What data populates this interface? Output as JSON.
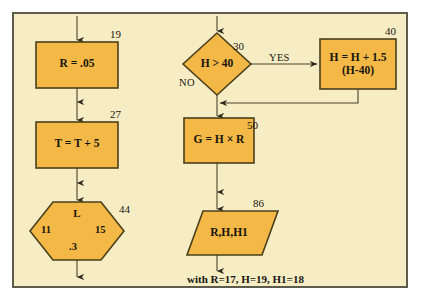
{
  "figure": {
    "type": "flowchart",
    "panel_background": "#f6edc4",
    "node_fill": "#f3b845",
    "node_stroke": "#4a3f1c",
    "line_color": "#4a4330",
    "text_color": "#171510"
  },
  "nodes": [
    {
      "id": "r-assign",
      "shape": "process",
      "text": "R = .05",
      "step": "19",
      "x": 36,
      "y": 42,
      "w": 82,
      "h": 46
    },
    {
      "id": "t-assign",
      "shape": "process",
      "text": "T = T + 5",
      "step": "27",
      "x": 36,
      "y": 122,
      "w": 82,
      "h": 46
    },
    {
      "id": "l-loop",
      "shape": "hexagon",
      "text": "L",
      "step": "44",
      "left_value": "11",
      "right_value": "15",
      "bottom_value": ".3",
      "x": 30,
      "y": 202,
      "w": 94,
      "h": 58
    },
    {
      "id": "h-test",
      "shape": "decision",
      "text": "H > 40",
      "step": "30",
      "yes_label": "YES",
      "no_label": "NO",
      "x": 183,
      "y": 33,
      "w": 68,
      "h": 62
    },
    {
      "id": "h-update",
      "shape": "process",
      "text": "H = H + 1.5\n(H-40)",
      "step": "40",
      "x": 320,
      "y": 39,
      "w": 76,
      "h": 50
    },
    {
      "id": "g-assign",
      "shape": "process",
      "text": "G = H × R",
      "step": "50",
      "x": 184,
      "y": 118,
      "w": 70,
      "h": 45
    },
    {
      "id": "output",
      "shape": "parallelogram",
      "text": "R,H,H1",
      "step": "86",
      "x": 190,
      "y": 211,
      "w": 78,
      "h": 44
    }
  ],
  "caption": "with R=17, H=19, H1=18"
}
